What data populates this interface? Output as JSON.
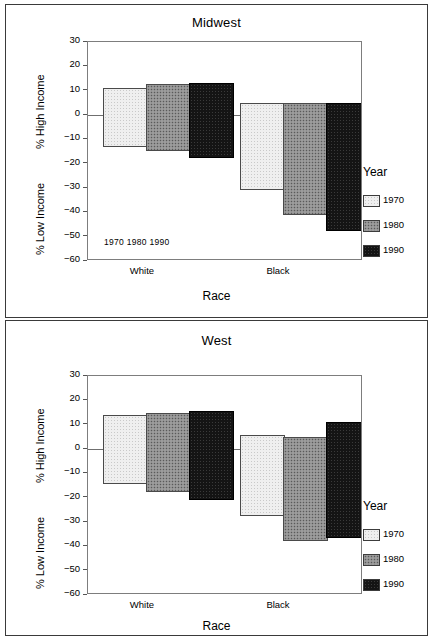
{
  "figure": {
    "panels": [
      {
        "id": "midwest",
        "title": "Midwest",
        "y_axis": {
          "upper_label": "% High Income",
          "lower_label": "% Low Income",
          "ticks": [
            "30",
            "20",
            "10",
            "0",
            "-10",
            "-20",
            "-30",
            "-40",
            "-50",
            "-60"
          ]
        },
        "x_axis": {
          "title": "Race",
          "categories": [
            "White",
            "Black"
          ],
          "year_marks": "1970  1980  1990"
        },
        "legend": {
          "title": "Year",
          "items": [
            {
              "label": "1970",
              "pattern": "light-dotted"
            },
            {
              "label": "1980",
              "pattern": "medium-gray-dotted"
            },
            {
              "label": "1990",
              "pattern": "black"
            }
          ]
        }
      },
      {
        "id": "west",
        "title": "West",
        "y_axis": {
          "upper_label": "% High Income",
          "lower_label": "% Low Income",
          "ticks": [
            "30",
            "20",
            "10",
            "0",
            "-10",
            "-20",
            "-30",
            "-40",
            "-50",
            "-60"
          ]
        },
        "x_axis": {
          "title": "Race",
          "categories": [
            "White",
            "Black"
          ],
          "year_marks": ""
        },
        "legend": {
          "title": "Year",
          "items": [
            {
              "label": "1970",
              "pattern": "light-dotted"
            },
            {
              "label": "1980",
              "pattern": "medium-gray-dotted"
            },
            {
              "label": "1990",
              "pattern": "black"
            }
          ]
        }
      }
    ]
  },
  "chart_data": [
    {
      "type": "bar",
      "title": "Midwest",
      "xlabel": "Race",
      "ylabel": "% High Income (positive) / % Low Income (negative)",
      "ylim": [
        -60,
        30
      ],
      "yticks": [
        30,
        20,
        10,
        0,
        -10,
        -20,
        -30,
        -40,
        -50,
        -60
      ],
      "grid": false,
      "legend_title": "Year",
      "legend_position": "right",
      "categories": [
        "White",
        "Black"
      ],
      "series": [
        {
          "name": "1970",
          "high_income": [
            11.0,
            4.8
          ],
          "low_income": [
            -13.3,
            -31.0
          ]
        },
        {
          "name": "1980",
          "high_income": [
            12.8,
            4.8
          ],
          "low_income": [
            -14.6,
            -41.0
          ]
        },
        {
          "name": "1990",
          "high_income": [
            13.3,
            5.0
          ],
          "low_income": [
            -17.5,
            -47.5
          ]
        }
      ]
    },
    {
      "type": "bar",
      "title": "West",
      "xlabel": "Race",
      "ylabel": "% High Income (positive) / % Low Income (negative)",
      "ylim": [
        -60,
        30
      ],
      "yticks": [
        30,
        20,
        10,
        0,
        -10,
        -20,
        -30,
        -40,
        -50,
        -60
      ],
      "grid": false,
      "legend_title": "Year",
      "legend_position": "right",
      "categories": [
        "White",
        "Black"
      ],
      "series": [
        {
          "name": "1970",
          "high_income": [
            13.8,
            5.8
          ],
          "low_income": [
            -14.2,
            -27.5
          ]
        },
        {
          "name": "1980",
          "high_income": [
            15.0,
            4.9
          ],
          "low_income": [
            -17.5,
            -38.0
          ]
        },
        {
          "name": "1990",
          "high_income": [
            15.8,
            11.0
          ],
          "low_income": [
            -20.8,
            -36.5
          ]
        }
      ]
    }
  ],
  "render": {
    "plot_height_px": 219,
    "y_top_value": 30,
    "y_bottom_value": -60,
    "group_starts_px": [
      15,
      152
    ],
    "bar_width_px": 45,
    "bar_offset_px": 43,
    "legend_left_px": 362,
    "colors": {
      "p1970": "#efefef",
      "p1980": "#8f8f8f",
      "p1990": "#141414",
      "axis": "#7d7d7d",
      "frame": "#3a3a3a"
    }
  }
}
